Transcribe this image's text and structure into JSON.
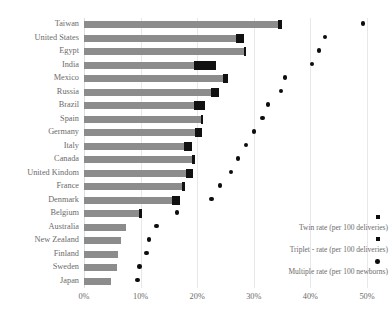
{
  "chart_data": {
    "type": "bar",
    "title": "",
    "subtitle": "",
    "xlabel": "",
    "ylabel": "",
    "xlim": [
      0,
      50
    ],
    "xtick_labels": [
      "0%",
      "10%",
      "20%",
      "30%",
      "40%",
      "50%"
    ],
    "xtick_values": [
      0,
      10,
      20,
      30,
      40,
      50
    ],
    "grid": true,
    "orientation": "horizontal",
    "legend_position": "inside-right",
    "categories": [
      "Taiwan",
      "United States",
      "Egypt",
      "India",
      "Mexico",
      "Russia",
      "Brazil",
      "Spain",
      "Germany",
      "Italy",
      "Canada",
      "United Kindom",
      "France",
      "Denmark",
      "Belgium",
      "Australia",
      "New Zealand",
      "Finland",
      "Sweden",
      "Japan"
    ],
    "series": [
      {
        "name": "Twin rate (per 100 deliveries)",
        "marker": "bar",
        "color": "#8c8c8c",
        "values": [
          34.9,
          28.2,
          28.6,
          23.3,
          25.5,
          23.8,
          21.4,
          21.0,
          20.8,
          19.0,
          19.6,
          19.2,
          17.9,
          17.0,
          10.2,
          7.5,
          6.5,
          6.0,
          5.8,
          4.8
        ]
      },
      {
        "name": "Triplet - rate (per 100 deliveries)",
        "marker": "square",
        "color": "#111111",
        "values": [
          0.6,
          1.3,
          0.3,
          3.8,
          1.0,
          1.4,
          2.0,
          0.4,
          1.2,
          1.4,
          0.5,
          1.2,
          0.5,
          1.5,
          0.4,
          0.0,
          0.0,
          0.0,
          0.0,
          0.0
        ]
      },
      {
        "name": "Multiple rate (per 100 newborns)",
        "marker": "dot",
        "color": "#0d0d0d",
        "values": [
          49.3,
          42.6,
          41.5,
          40.3,
          35.5,
          34.8,
          32.5,
          31.5,
          30.0,
          28.6,
          27.2,
          26.0,
          24.0,
          22.5,
          16.4,
          12.8,
          11.5,
          11.0,
          9.8,
          9.5
        ]
      }
    ]
  },
  "legend": {
    "entries": [
      {
        "label": "Twin rate (per 100 deliveries)",
        "marker": "square"
      },
      {
        "label": "Triplet - rate (per 100 deliveries)",
        "marker": "square"
      },
      {
        "label": "Multiple rate (per 100 newborns)",
        "marker": "dot"
      }
    ]
  }
}
